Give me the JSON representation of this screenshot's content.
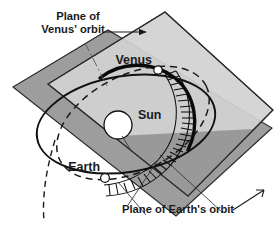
{
  "figure": {
    "background_color": "#ffffff",
    "width": 275,
    "height": 231
  },
  "labels": {
    "venus_plane_line1": "Plane of",
    "venus_plane_line2": "Venus' orbit",
    "earth_plane": "Plane of Earth's orbit",
    "sun": "Sun",
    "venus": "Venus",
    "earth": "Earth"
  },
  "planes": [
    {
      "id": "venus-plane",
      "name": "Plane of Venus' orbit",
      "fill": "#d2d2d2",
      "edge_color": "#2b2b2b",
      "orientation": "steeply tilted, upper right"
    },
    {
      "id": "earth-plane",
      "name": "Plane of Earth's orbit",
      "fill": "#9d9d9d",
      "edge_color": "#2b2b2b",
      "orientation": "shallow, lower left"
    }
  ],
  "orbits": [
    {
      "id": "earth-orbit",
      "name": "Earth's orbit",
      "style": "solid",
      "color": "#111111",
      "lies_in_plane": "earth-plane"
    },
    {
      "id": "venus-orbit",
      "name": "Venus' orbit",
      "style": "dashed",
      "color": "#1a1a1a",
      "lies_in_plane": "venus-plane"
    }
  ],
  "bodies": [
    {
      "id": "sun",
      "label": "Sun",
      "marker": "white-disc",
      "radius_px": 14
    },
    {
      "id": "venus",
      "label": "Venus",
      "marker": "white-dot",
      "radius_px": 4
    },
    {
      "id": "earth",
      "label": "Earth",
      "marker": "white-dot",
      "radius_px": 4
    }
  ],
  "annotations": {
    "connecting_band": {
      "id": "sightline-band",
      "description": "Hatched ladder band of sight lines joining Venus to Earth",
      "style": "ladder-hatching",
      "color": "#0d0d0d",
      "rung_count": 26
    },
    "leader_lines": [
      {
        "for": "Plane of Venus' orbit",
        "kind": "arrow",
        "direction": "right"
      },
      {
        "for": "Plane of Venus' orbit",
        "kind": "dash-dot pointer",
        "direction": "down-right"
      },
      {
        "for": "Plane of Earth's orbit",
        "kind": "arrow",
        "direction": "up-right"
      },
      {
        "for": "Plane of Earth's orbit",
        "kind": "pointer",
        "direction": "up-left"
      }
    ]
  },
  "colors": {
    "venus_plane_fill": "#d2d2d2",
    "earth_plane_fill": "#9d9d9d",
    "overlap_fill": "#8f8f8f",
    "line": "#111111",
    "text": "#1a1a1a",
    "page": "#ffffff"
  }
}
